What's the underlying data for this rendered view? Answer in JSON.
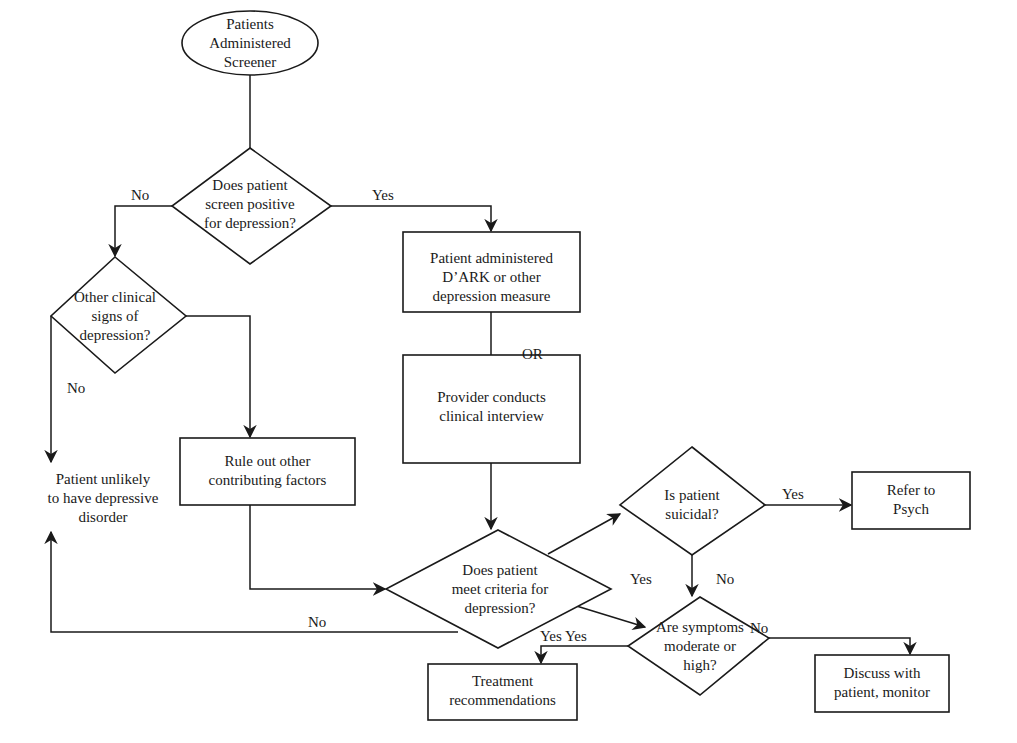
{
  "diagram": {
    "type": "flowchart",
    "colors": {
      "line": "#1a1a1a",
      "background": "#ffffff"
    },
    "nodes": {
      "start": {
        "shape": "ellipse",
        "lines": [
          "Patients",
          "Administered",
          "Screener"
        ]
      },
      "screen_positive": {
        "shape": "diamond",
        "lines": [
          "Does patient",
          "screen positive",
          "for depression?"
        ]
      },
      "other_signs": {
        "shape": "diamond",
        "lines": [
          "Other clinical",
          "signs of",
          "depression?"
        ]
      },
      "administer_measure": {
        "shape": "rect",
        "lines": [
          "Patient administered",
          "D’ARK or other",
          "depression measure"
        ]
      },
      "clinical_interview": {
        "shape": "rect",
        "lines": [
          "Provider conducts",
          "clinical interview"
        ]
      },
      "unlikely": {
        "shape": "text",
        "lines": [
          "Patient unlikely",
          "to have depressive",
          "disorder"
        ]
      },
      "rule_out": {
        "shape": "rect",
        "lines": [
          "Rule out other",
          "contributing factors"
        ]
      },
      "meet_criteria": {
        "shape": "diamond",
        "lines": [
          "Does patient",
          "meet criteria for",
          "depression?"
        ]
      },
      "suicidal": {
        "shape": "diamond",
        "lines": [
          "Is patient",
          "suicidal?"
        ]
      },
      "refer_psych": {
        "shape": "rect",
        "lines": [
          "Refer to",
          "Psych"
        ]
      },
      "symptoms_level": {
        "shape": "diamond",
        "lines": [
          "Are symptoms",
          "moderate or",
          "high?"
        ]
      },
      "treatment": {
        "shape": "rect",
        "lines": [
          "Treatment",
          "recommendations"
        ]
      },
      "discuss_monitor": {
        "shape": "rect",
        "lines": [
          "Discuss with",
          "patient, monitor"
        ]
      }
    },
    "edge_labels": {
      "screen_no": "No",
      "screen_yes": "Yes",
      "or_label": "OR",
      "signs_no": "No",
      "criteria_no": "No",
      "criteria_yes_suicidal": "Yes",
      "criteria_yes_symptoms": "Yes",
      "suicidal_yes": "Yes",
      "suicidal_no": "No",
      "symptoms_yes": "Yes",
      "symptoms_no": "No"
    }
  }
}
